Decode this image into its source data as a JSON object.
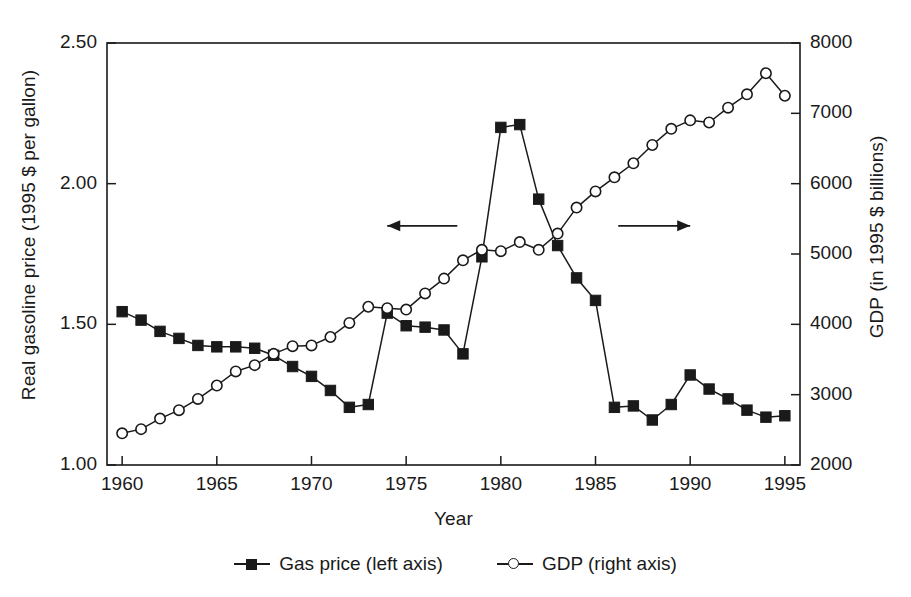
{
  "chart_data": {
    "type": "line",
    "title": "",
    "xlabel": "Year",
    "ylabel": "Real gasoline price (1995 $ per gallon)",
    "ylabel_right": "GDP (in 1995 $ billions)",
    "x": [
      1960,
      1961,
      1962,
      1963,
      1964,
      1965,
      1966,
      1967,
      1968,
      1969,
      1970,
      1971,
      1972,
      1973,
      1974,
      1975,
      1976,
      1977,
      1978,
      1979,
      1980,
      1981,
      1982,
      1983,
      1984,
      1985,
      1986,
      1987,
      1988,
      1989,
      1990,
      1991,
      1992,
      1993,
      1994,
      1995
    ],
    "xlim": [
      1959.2,
      1995.8
    ],
    "ylim": [
      1.0,
      2.5
    ],
    "ylim_right": [
      2000,
      8000
    ],
    "xticks": [
      1960,
      1965,
      1970,
      1975,
      1980,
      1985,
      1990,
      1995
    ],
    "xtick_labels": [
      "1960",
      "1965",
      "1970",
      "1975",
      "1980",
      "1985",
      "1990",
      "1995"
    ],
    "yticks_left": [
      1.0,
      1.5,
      2.0,
      2.5
    ],
    "ytick_labels_left": [
      "1.00",
      "1.50",
      "2.00",
      "2.50"
    ],
    "yticks_right": [
      2000,
      3000,
      4000,
      5000,
      6000,
      7000,
      8000
    ],
    "ytick_labels_right": [
      "2000",
      "3000",
      "4000",
      "5000",
      "6000",
      "7000",
      "8000"
    ],
    "grid": false,
    "legend_position": "below",
    "series": [
      {
        "name": "Gas price (left axis)",
        "axis": "left",
        "marker": "filled-square",
        "color": "#1a1a1a",
        "values": [
          1.545,
          1.515,
          1.475,
          1.45,
          1.425,
          1.42,
          1.42,
          1.415,
          1.39,
          1.35,
          1.315,
          1.265,
          1.205,
          1.215,
          1.54,
          1.495,
          1.49,
          1.48,
          1.395,
          1.74,
          2.2,
          2.21,
          1.945,
          1.78,
          1.665,
          1.585,
          1.205,
          1.21,
          1.16,
          1.215,
          1.32,
          1.27,
          1.235,
          1.195,
          1.17,
          1.175
        ]
      },
      {
        "name": "GDP (right axis)",
        "axis": "right",
        "marker": "open-circle",
        "color": "#1a1a1a",
        "values": [
          2450,
          2510,
          2660,
          2780,
          2940,
          3130,
          3330,
          3420,
          3580,
          3690,
          3700,
          3820,
          4020,
          4250,
          4230,
          4210,
          4440,
          4650,
          4910,
          5060,
          5040,
          5170,
          5060,
          5290,
          5660,
          5890,
          6090,
          6290,
          6550,
          6780,
          6900,
          6870,
          7080,
          7270,
          7570,
          7250
        ]
      }
    ],
    "annotations": [
      {
        "type": "arrow",
        "direction": "left",
        "x_from": 1977.7,
        "x_to": 1974.0,
        "y_value": 1.85
      },
      {
        "type": "arrow",
        "direction": "right",
        "x_from": 1986.2,
        "x_to": 1990.0,
        "y_value": 1.85
      }
    ]
  },
  "legend": {
    "items": [
      {
        "label": "Gas price (left axis)",
        "marker": "filled-square"
      },
      {
        "label": "GDP (right axis)",
        "marker": "open-circle"
      }
    ]
  }
}
